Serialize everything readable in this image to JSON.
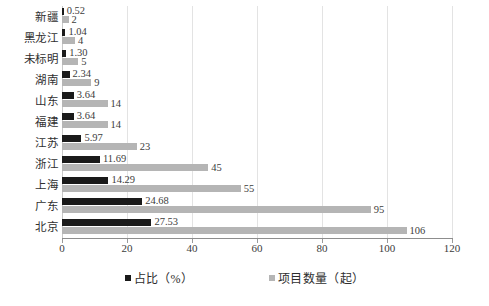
{
  "chart_data": {
    "type": "bar",
    "orientation": "horizontal",
    "title": "",
    "xlabel": "",
    "ylabel": "",
    "xlim": [
      0,
      120
    ],
    "xticks": [
      0,
      20,
      40,
      60,
      80,
      100,
      120
    ],
    "grid": true,
    "legend_position": "bottom",
    "categories": [
      "新疆",
      "黑龙江",
      "未标明",
      "湖南",
      "山东",
      "福建",
      "江苏",
      "浙江",
      "上海",
      "广东",
      "北京"
    ],
    "series": [
      {
        "name": "占比（%）",
        "color": "#1a1a1a",
        "values": [
          0.52,
          1.04,
          1.3,
          2.34,
          3.64,
          3.64,
          5.97,
          11.69,
          14.29,
          24.68,
          27.53
        ],
        "labels": [
          "0.52",
          "1.04",
          "1.30",
          "2.34",
          "3.64",
          "3.64",
          "5.97",
          "11.69",
          "14.29",
          "24.68",
          "27.53"
        ]
      },
      {
        "name": "项目数量（起）",
        "color": "#b5b5b5",
        "values": [
          2,
          4,
          5,
          9,
          14,
          14,
          23,
          45,
          55,
          95,
          106
        ],
        "labels": [
          "2",
          "4",
          "5",
          "9",
          "14",
          "14",
          "23",
          "45",
          "55",
          "95",
          "106"
        ]
      }
    ]
  },
  "legend": {
    "items": [
      {
        "label": "占比（%）",
        "swatch": "legend-swatch-pct"
      },
      {
        "label": "项目数量（起）",
        "swatch": "legend-swatch-count"
      }
    ]
  }
}
